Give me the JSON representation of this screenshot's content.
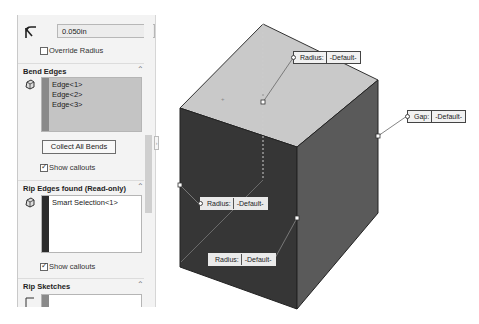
{
  "property_manager": {
    "radius_field": {
      "icon": "bend-radius-icon",
      "value": "0.050in"
    },
    "override_radius": {
      "label": "Override Radius",
      "checked": false
    },
    "bend_edges": {
      "title": "Bend Edges",
      "icon": "edge-selection-icon",
      "items": [
        "Edge<1>",
        "Edge<2>",
        "Edge<3>"
      ],
      "collect_button": "Collect All Bends",
      "show_callouts": {
        "label": "Show callouts",
        "checked": true
      }
    },
    "rip_edges": {
      "title": "Rip Edges found (Read-only)",
      "icon": "edge-selection-icon",
      "items": [
        "Smart Selection<1>"
      ],
      "show_callouts": {
        "label": "Show callouts",
        "checked": true
      }
    },
    "rip_sketches": {
      "title": "Rip Sketches",
      "icon": "sketch-selection-icon",
      "items": []
    },
    "collapse_icon": "chevron-up-icon"
  },
  "graphics_area": {
    "callouts": [
      {
        "id": "top",
        "key": "Radius:",
        "value": "-Default-"
      },
      {
        "id": "gap",
        "key": "Gap:",
        "value": "-Default-"
      },
      {
        "id": "left",
        "key": "Radius:",
        "value": "-Default-"
      },
      {
        "id": "bottom",
        "key": "Radius:",
        "value": "-Default-"
      }
    ],
    "colors": {
      "top_face": "#c9c9c9",
      "front_face": "#363636",
      "side_face": "#5a5a5a",
      "bend_bar": "#8a8a8a",
      "rip_bar": "#2b2b2b"
    }
  }
}
